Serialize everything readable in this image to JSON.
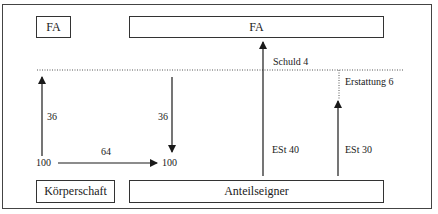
{
  "diagram": {
    "boxes": {
      "fa_left": "FA",
      "fa_right": "FA",
      "corporation": "Körperschaft",
      "shareholder": "Anteilseigner"
    },
    "labels": {
      "corp_tax_paid": "36",
      "credit_received": "36",
      "dividend": "64",
      "corp_income": "100",
      "shareholder_income": "100",
      "income_tax_40": "ESt 40",
      "income_tax_30": "ESt 30",
      "debt": "Schuld 4",
      "refund": "Erstattung 6"
    }
  }
}
